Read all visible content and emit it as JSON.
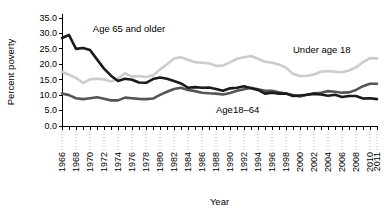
{
  "chart_data": {
    "type": "line",
    "title": "",
    "xlabel": "Year",
    "ylabel": "Percent poverty",
    "ylim": [
      0,
      35
    ],
    "yticks": [
      "0.0",
      "5.0",
      "10.0",
      "15.0",
      "20.0",
      "25.0",
      "30.0",
      "35.0"
    ],
    "xlim": [
      1966,
      2011
    ],
    "grid": false,
    "legend": "inline-annotations",
    "x": [
      1966,
      1967,
      1968,
      1969,
      1970,
      1971,
      1972,
      1973,
      1974,
      1975,
      1976,
      1977,
      1978,
      1979,
      1980,
      1981,
      1982,
      1983,
      1984,
      1985,
      1986,
      1987,
      1988,
      1989,
      1990,
      1991,
      1992,
      1993,
      1994,
      1995,
      1996,
      1997,
      1998,
      1999,
      2000,
      2001,
      2002,
      2003,
      2004,
      2005,
      2006,
      2007,
      2008,
      2009,
      2010,
      2011
    ],
    "xtick_labels": [
      "1966",
      "1968",
      "1970",
      "1972",
      "1974",
      "1976",
      "1978",
      "1980",
      "1982",
      "1984",
      "1986",
      "1988",
      "1990",
      "1992",
      "1994",
      "1996",
      "1998",
      "2000",
      "2002",
      "2004",
      "2006",
      "2008",
      "2010",
      "2011"
    ],
    "series": [
      {
        "name": "Age 65 and older",
        "label": "Age 65 and older",
        "color": "#1a1a1a",
        "width": 2.6,
        "label_x": 1970.4,
        "label_y": 30.4,
        "values": [
          28.5,
          29.5,
          25.0,
          25.3,
          24.6,
          21.6,
          18.6,
          16.3,
          14.6,
          15.3,
          15.0,
          14.1,
          14.0,
          15.2,
          15.7,
          15.3,
          14.6,
          13.8,
          12.4,
          12.6,
          12.4,
          12.5,
          12.0,
          11.4,
          12.2,
          12.4,
          12.9,
          12.2,
          11.7,
          10.5,
          10.8,
          10.5,
          10.5,
          9.7,
          9.9,
          10.1,
          10.4,
          10.2,
          9.8,
          10.1,
          9.4,
          9.7,
          9.7,
          8.9,
          9.0,
          8.7
        ]
      },
      {
        "name": "Age 18-64",
        "label": "Age18–64",
        "color": "#555555",
        "width": 2.6,
        "label_x": 1988.0,
        "label_y": 4.2,
        "values": [
          10.5,
          10.0,
          9.0,
          8.7,
          9.0,
          9.3,
          8.8,
          8.3,
          8.3,
          9.2,
          9.0,
          8.8,
          8.7,
          8.9,
          10.1,
          11.1,
          12.0,
          12.4,
          11.7,
          11.3,
          10.8,
          10.6,
          10.5,
          10.2,
          10.7,
          11.4,
          11.9,
          12.4,
          11.9,
          11.4,
          11.4,
          10.9,
          10.5,
          10.0,
          9.6,
          10.1,
          10.6,
          10.8,
          11.3,
          11.1,
          10.8,
          10.9,
          11.7,
          12.9,
          13.7,
          13.7
        ]
      },
      {
        "name": "Under age 18",
        "label": "Under age 18",
        "color": "#cccccc",
        "width": 2.6,
        "label_x": 1999.0,
        "label_y": 23.6,
        "values": [
          17.6,
          16.6,
          15.6,
          14.0,
          15.1,
          15.3,
          15.1,
          14.4,
          15.4,
          17.1,
          16.0,
          16.2,
          15.9,
          16.4,
          18.3,
          20.0,
          21.9,
          22.3,
          21.5,
          20.7,
          20.5,
          20.3,
          19.5,
          19.6,
          20.6,
          21.8,
          22.3,
          22.7,
          21.8,
          20.8,
          20.5,
          19.9,
          18.9,
          16.9,
          16.2,
          16.3,
          16.7,
          17.6,
          17.8,
          17.6,
          17.4,
          18.0,
          19.0,
          20.7,
          22.0,
          21.9
        ]
      }
    ]
  }
}
